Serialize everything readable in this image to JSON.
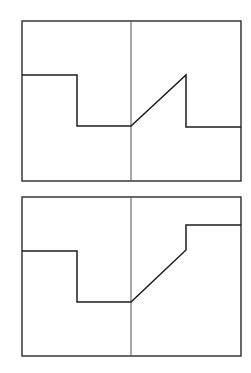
{
  "diagram": {
    "colors": {
      "stroke": "#1e1e1e",
      "frame": "#2a2a2a",
      "center_line": "#555555",
      "background": "#ffffff"
    },
    "panels": [
      {
        "name": "panel-top",
        "frame": {
          "x": 22,
          "y": 21,
          "width": 219,
          "height": 160
        },
        "center_line_x": 131,
        "waveform_points": "22,75 77,75 77,126 131,126 186,75 186,127 241,127"
      },
      {
        "name": "panel-bottom",
        "frame": {
          "x": 22,
          "y": 197,
          "width": 219,
          "height": 159
        },
        "center_line_x": 131,
        "waveform_points": "22,251 77,251 77,302 131,302 186,250 186,225 241,225"
      }
    ]
  }
}
